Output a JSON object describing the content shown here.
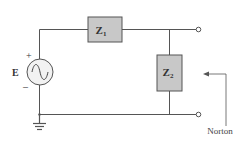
{
  "diagram": {
    "type": "circuit",
    "source": {
      "label": "E",
      "plus": "+",
      "minus": "–",
      "kind": "ac-voltage-source"
    },
    "z1": {
      "label": "Z",
      "sub": "1"
    },
    "z2": {
      "label": "Z",
      "sub": "2"
    },
    "annotation": {
      "label": "Norton"
    },
    "colors": {
      "wire": "#555555",
      "box_fill": "#c8c8c8",
      "box_stroke": "#555555",
      "source_fill": "#f2f2f2",
      "text": "#333333"
    }
  }
}
